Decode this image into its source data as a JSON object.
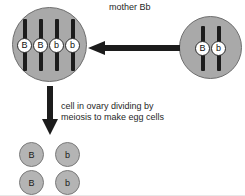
{
  "diagram": {
    "title_label": "mother Bb",
    "process_label_line1": "cell in ovary dividing by",
    "process_label_line2": "meiosis to make egg cells",
    "colors": {
      "cell_fill": "#a9a9a9",
      "cell_stroke": "#6e6e6e",
      "chromosome": "#1c1c1c",
      "arrow": "#1c1c1c",
      "egg_fill": "#b4b4b4",
      "text": "#1f1f1f",
      "background": "#ffffff"
    },
    "mother_cell": {
      "name": "mother cell",
      "genotype": "Bb",
      "chromosome_count": 4,
      "alleles": [
        "B",
        "B",
        "b",
        "b"
      ]
    },
    "source_cell": {
      "name": "source cell",
      "genotype": "Bb",
      "chromosome_count": 2,
      "alleles": [
        "B",
        "b"
      ]
    },
    "egg_cells": [
      {
        "allele": "B",
        "row": 1,
        "col": 1
      },
      {
        "allele": "b",
        "row": 1,
        "col": 2
      },
      {
        "allele": "B",
        "row": 2,
        "col": 1
      },
      {
        "allele": "b",
        "row": 2,
        "col": 2
      }
    ],
    "arrows": [
      {
        "name": "arrow-left",
        "direction": "left"
      },
      {
        "name": "arrow-down",
        "direction": "down"
      }
    ]
  }
}
